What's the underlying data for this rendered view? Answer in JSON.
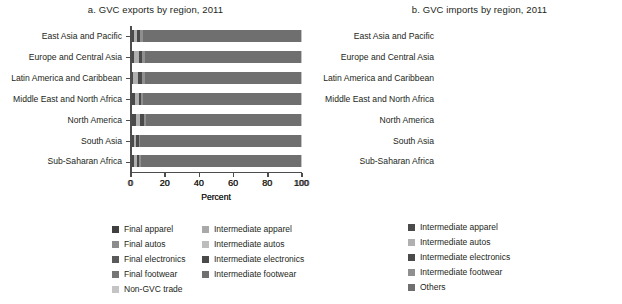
{
  "figure": {
    "panels": [
      {
        "key": "a",
        "title": "a. GVC exports by region, 2011",
        "xlabel": "Percent"
      },
      {
        "key": "b",
        "title": "b. GVC imports by region, 2011",
        "xlabel": "Percent"
      }
    ]
  },
  "colors": {
    "final_apparel": "#3f3f3f",
    "final_autos": "#8c8c8c",
    "final_electronics": "#5a5a5a",
    "final_footwear": "#767676",
    "non_gvc_trade": "#c4c4c4",
    "intermediate_apparel": "#a9a9a9",
    "intermediate_autos": "#bdbdbd",
    "intermediate_electronics": "#4a4a4a",
    "intermediate_footwear": "#707070",
    "others": "#6f6f6f",
    "axis": "#4d4d4d",
    "text": "#231f20"
  },
  "legend_a": {
    "column1": [
      {
        "label": "Final apparel",
        "color_key": "final_apparel",
        "swatch": "#3f3f3f"
      },
      {
        "label": "Final autos",
        "color_key": "final_autos",
        "swatch": "#8c8c8c"
      },
      {
        "label": "Final electronics",
        "color_key": "final_electronics",
        "swatch": "#5a5a5a"
      },
      {
        "label": "Final footwear",
        "color_key": "final_footwear",
        "swatch": "#767676"
      },
      {
        "label": "Non-GVC trade",
        "color_key": "non_gvc_trade",
        "swatch": "#c4c4c4"
      }
    ],
    "column2": [
      {
        "label": "Intermediate apparel",
        "color_key": "intermediate_apparel",
        "swatch": "#a9a9a9"
      },
      {
        "label": "Intermediate autos",
        "color_key": "intermediate_autos",
        "swatch": "#bdbdbd"
      },
      {
        "label": "Intermediate electronics",
        "color_key": "intermediate_electronics",
        "swatch": "#4a4a4a"
      },
      {
        "label": "Intermediate footwear",
        "color_key": "intermediate_footwear",
        "swatch": "#707070"
      }
    ]
  },
  "legend_b": [
    {
      "label": "Intermediate apparel",
      "color_key": "intermediate_apparel",
      "swatch": "#4a4a4a"
    },
    {
      "label": "Intermediate autos",
      "color_key": "intermediate_autos",
      "swatch": "#b0b0b0"
    },
    {
      "label": "Intermediate electronics",
      "color_key": "intermediate_electronics",
      "swatch": "#4a4a4a"
    },
    {
      "label": "Intermediate footwear",
      "color_key": "intermediate_footwear",
      "swatch": "#8f8f8f"
    },
    {
      "label": "Others",
      "color_key": "others",
      "swatch": "#6f6f6f"
    }
  ],
  "chart_data": [
    {
      "type": "bar",
      "orientation": "horizontal",
      "stacked": true,
      "panel": "a",
      "title": "a. GVC exports by region, 2011",
      "xlabel": "Percent",
      "ylabel": "",
      "xlim": [
        0,
        100
      ],
      "xticks": [
        0,
        20,
        40,
        60,
        80,
        100
      ],
      "grid": false,
      "legend_position": "below",
      "categories": [
        "East Asia and Pacific",
        "Europe and Central Asia",
        "Latin America and Caribbean",
        "Middle East and North Africa",
        "North America",
        "South Asia",
        "Sub-Saharan Africa"
      ],
      "series": [
        {
          "name": "Final apparel",
          "color": "#3f3f3f",
          "values": [
            2.5,
            1.5,
            1.5,
            0.4,
            1.0,
            9.5,
            1.5
          ]
        },
        {
          "name": "Final autos",
          "color": "#8c8c8c",
          "values": [
            1.5,
            1.0,
            1.3,
            0.2,
            1.4,
            1.0,
            0.4
          ]
        },
        {
          "name": "Final electronics",
          "color": "#5a5a5a",
          "values": [
            2.5,
            1.2,
            1.2,
            0.3,
            1.6,
            1.5,
            0.4
          ]
        },
        {
          "name": "Final footwear",
          "color": "#767676",
          "values": [
            1.0,
            0.5,
            0.5,
            0.2,
            0.5,
            0.8,
            0.3
          ]
        },
        {
          "name": "Intermediate apparel",
          "color": "#a9a9a9",
          "values": [
            2.5,
            2.0,
            2.0,
            0.3,
            1.3,
            1.2,
            0.6
          ]
        },
        {
          "name": "Intermediate autos",
          "color": "#bdbdbd",
          "values": [
            2.0,
            2.3,
            2.0,
            0.3,
            2.2,
            0.8,
            0.6
          ]
        },
        {
          "name": "Intermediate electronics",
          "color": "#4a4a4a",
          "values": [
            13.0,
            6.0,
            6.0,
            0.4,
            5.0,
            4.0,
            1.0
          ]
        },
        {
          "name": "Intermediate footwear",
          "color": "#707070",
          "values": [
            3.5,
            2.0,
            2.0,
            0.2,
            1.5,
            4.5,
            1.2
          ]
        },
        {
          "name": "Non-GVC trade",
          "color": "#c4c4c4",
          "values": [
            71.5,
            83.5,
            83.5,
            97.7,
            85.5,
            76.7,
            94.0
          ]
        }
      ]
    },
    {
      "type": "bar",
      "orientation": "horizontal",
      "stacked": true,
      "panel": "b",
      "title": "b. GVC imports by region, 2011",
      "xlabel": "Percent",
      "ylabel": "",
      "xlim": [
        0,
        100
      ],
      "xticks": [
        0,
        20,
        40,
        60,
        80,
        100
      ],
      "grid": false,
      "legend_position": "below",
      "categories": [
        "East Asia and Pacific",
        "Europe and Central Asia",
        "Latin America and Caribbean",
        "Middle East and North Africa",
        "North America",
        "South Asia",
        "Sub-Saharan Africa"
      ],
      "series": [
        {
          "name": "Intermediate apparel",
          "color": "#4a4a4a",
          "values": [
            1.5,
            1.5,
            1.0,
            2.5,
            3.0,
            1.5,
            1.5
          ]
        },
        {
          "name": "Intermediate autos",
          "color": "#b0b0b0",
          "values": [
            2.0,
            3.0,
            3.0,
            2.0,
            2.5,
            1.5,
            2.0
          ]
        },
        {
          "name": "Intermediate electronics",
          "color": "#4a4a4a",
          "values": [
            2.0,
            2.0,
            2.5,
            1.5,
            2.0,
            1.5,
            1.5
          ]
        },
        {
          "name": "Intermediate footwear",
          "color": "#8f8f8f",
          "values": [
            1.5,
            1.5,
            1.5,
            1.0,
            1.5,
            1.0,
            1.0
          ]
        },
        {
          "name": "Others",
          "color": "#6f6f6f",
          "values": [
            93.0,
            92.0,
            92.0,
            93.0,
            91.0,
            94.5,
            94.0
          ]
        }
      ]
    }
  ]
}
